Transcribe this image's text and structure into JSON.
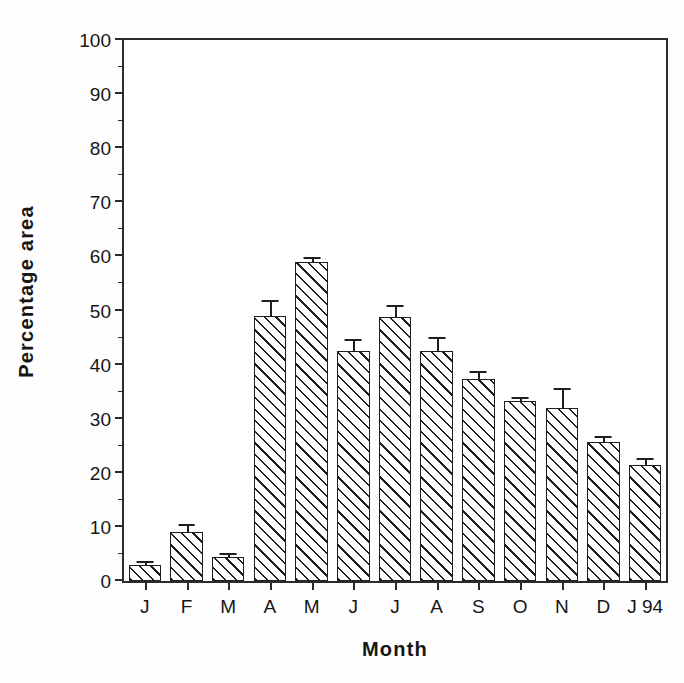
{
  "chart_data": {
    "type": "bar",
    "title": "",
    "xlabel": "Month",
    "ylabel": "Percentage  area",
    "ylim": [
      0,
      100
    ],
    "ytick_step": 10,
    "yminor_step": 5,
    "grid": false,
    "legend": null,
    "categories": [
      "J",
      "F",
      "M",
      "A",
      "M",
      "J",
      "J",
      "A",
      "S",
      "O",
      "N",
      "D",
      "J 94"
    ],
    "ytick_labels": [
      "0",
      "10",
      "20",
      "30",
      "40",
      "50",
      "60",
      "70",
      "80",
      "90",
      "100"
    ],
    "values": [
      2.9,
      9.1,
      4.4,
      49.0,
      59.0,
      42.6,
      48.8,
      42.6,
      37.3,
      33.2,
      32.0,
      25.7,
      21.5
    ],
    "errors": [
      0.4,
      1.0,
      0.4,
      2.6,
      0.6,
      1.8,
      1.8,
      2.1,
      1.1,
      0.5,
      3.4,
      0.7,
      0.8
    ],
    "series": [
      {
        "name": "Percentage area",
        "values": [
          2.9,
          9.1,
          4.4,
          49.0,
          59.0,
          42.6,
          48.8,
          42.6,
          37.3,
          33.2,
          32.0,
          25.7,
          21.5
        ],
        "errors": [
          0.4,
          1.0,
          0.4,
          2.6,
          0.6,
          1.8,
          1.8,
          2.1,
          1.1,
          0.5,
          3.4,
          0.7,
          0.8
        ]
      }
    ],
    "bar_style": "diagonal-hatch",
    "colors": {
      "axis": "#2b2b2b",
      "bar_outline": "#1f1f1f",
      "bar_fill": "#ffffff",
      "hatch": "#1f1f1f",
      "text": "#161616",
      "background": "#ffffff"
    }
  }
}
